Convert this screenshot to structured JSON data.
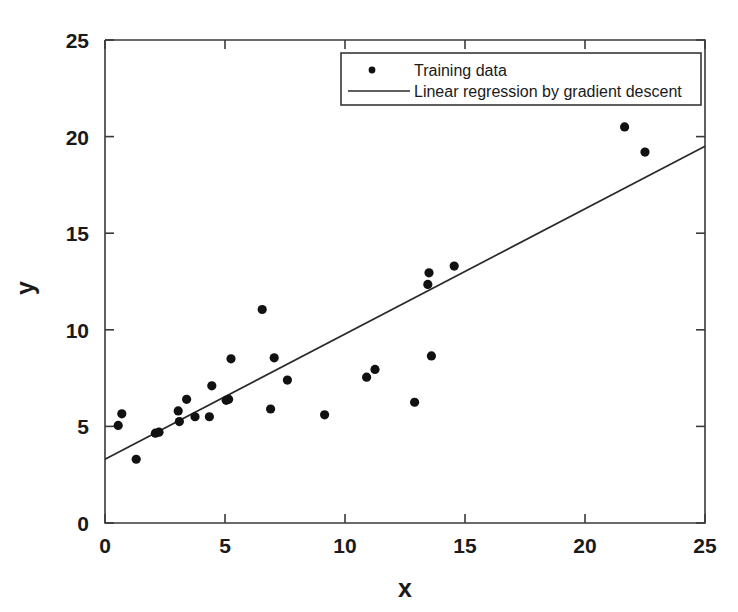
{
  "chart_data": {
    "type": "scatter",
    "title": "",
    "xlabel": "x",
    "ylabel": "y",
    "xlim": [
      0,
      25
    ],
    "ylim": [
      0,
      25
    ],
    "xticks": [
      0,
      5,
      10,
      15,
      20,
      25
    ],
    "yticks": [
      0,
      5,
      10,
      15,
      20,
      25
    ],
    "xtick_labels": [
      "0",
      "5",
      "10",
      "15",
      "20",
      "25"
    ],
    "ytick_labels": [
      "0",
      "5",
      "10",
      "15",
      "20",
      "25"
    ],
    "grid": false,
    "legend_position": "upper right",
    "series": [
      {
        "name": "Training data",
        "type": "scatter",
        "marker": "circle",
        "color": "#111111",
        "points": [
          [
            0.55,
            5.05
          ],
          [
            0.7,
            5.65
          ],
          [
            1.3,
            3.3
          ],
          [
            2.1,
            4.65
          ],
          [
            2.25,
            4.7
          ],
          [
            3.05,
            5.8
          ],
          [
            3.1,
            5.25
          ],
          [
            3.4,
            6.4
          ],
          [
            3.75,
            5.5
          ],
          [
            4.35,
            5.5
          ],
          [
            4.45,
            7.1
          ],
          [
            5.05,
            6.35
          ],
          [
            5.15,
            6.4
          ],
          [
            5.25,
            8.5
          ],
          [
            6.55,
            11.05
          ],
          [
            6.9,
            5.9
          ],
          [
            7.05,
            8.55
          ],
          [
            7.6,
            7.4
          ],
          [
            9.15,
            5.6
          ],
          [
            10.9,
            7.55
          ],
          [
            11.25,
            7.95
          ],
          [
            12.9,
            6.25
          ],
          [
            13.45,
            12.35
          ],
          [
            13.5,
            12.95
          ],
          [
            13.6,
            8.65
          ],
          [
            14.55,
            13.3
          ],
          [
            21.65,
            20.5
          ],
          [
            22.5,
            19.2
          ]
        ]
      },
      {
        "name": "Linear regression by gradient descent",
        "type": "line",
        "color": "#2a2a2a",
        "endpoints": [
          [
            0,
            3.3
          ],
          [
            25,
            19.5
          ]
        ],
        "slope": 0.648,
        "intercept": 3.3
      }
    ],
    "legend": [
      {
        "label": "Training data",
        "marker": "circle"
      },
      {
        "label": "Linear regression by gradient descent",
        "marker": "line"
      }
    ]
  }
}
